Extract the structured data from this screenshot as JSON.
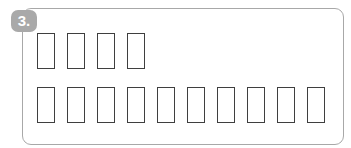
{
  "exercise": {
    "number_label": "3.",
    "rows": [
      {
        "box_count": 4
      },
      {
        "box_count": 10
      }
    ],
    "colors": {
      "badge": "#a9a9a9",
      "card_border": "#a8a8a8",
      "box_border": "#3f3f3f"
    }
  }
}
